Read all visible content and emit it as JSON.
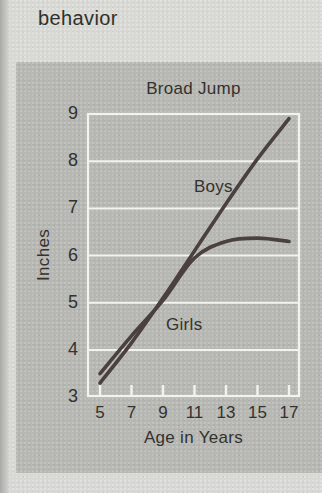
{
  "page": {
    "heading": "behavior"
  },
  "colors": {
    "page_bg": "#d8d8d4",
    "panel_bg": "#b7b7b3",
    "gridline": "#f3f3ee",
    "curve": "#4a403d",
    "text": "#33322e"
  },
  "chart_data": {
    "type": "line",
    "title": "Broad Jump",
    "xlabel": "Age in Years",
    "ylabel": "Inches",
    "xlim": [
      5,
      17
    ],
    "ylim": [
      3,
      9
    ],
    "x_ticks": [
      5,
      7,
      9,
      11,
      13,
      15,
      17
    ],
    "y_ticks_displayed_top_to_bottom": [
      9,
      8,
      7,
      6,
      5,
      4,
      3
    ],
    "grid": "horizontal white gridlines at each inch, white plot border, white x tick marks",
    "legend_position": "labels annotated next to curves",
    "series": [
      {
        "name": "Boys",
        "x": [
          5,
          7,
          9,
          11,
          13,
          15,
          17
        ],
        "values": [
          3.3,
          4.15,
          5.1,
          6.1,
          7.1,
          8.05,
          8.9
        ],
        "label_at": {
          "x": 12.2,
          "y": 7.45
        }
      },
      {
        "name": "Girls",
        "x": [
          5,
          7,
          9,
          11,
          13,
          15,
          17
        ],
        "values": [
          3.5,
          4.3,
          5.05,
          5.95,
          6.3,
          6.37,
          6.3
        ],
        "label_at": {
          "x": 10.35,
          "y": 4.52
        }
      }
    ]
  }
}
